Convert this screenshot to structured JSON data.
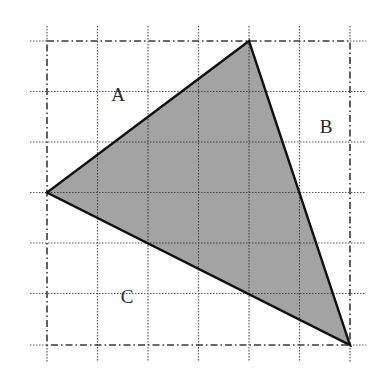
{
  "diagram": {
    "type": "grid-triangle",
    "grid": {
      "columns": 6,
      "rows": 6,
      "origin_px": [
        47,
        41
      ],
      "cell_px": 50.5,
      "line_color": "#555555",
      "border_style": "dash-dot",
      "inner_style": "dotted"
    },
    "triangle": {
      "vertices_grid": [
        [
          4,
          0
        ],
        [
          0,
          3
        ],
        [
          6,
          6
        ]
      ],
      "fill": "#9a9a9a",
      "stroke": "#111111"
    },
    "labels": [
      {
        "id": "A",
        "text": "A",
        "x": 118,
        "y": 101
      },
      {
        "id": "B",
        "text": "B",
        "x": 326,
        "y": 133
      },
      {
        "id": "C",
        "text": "C",
        "x": 127,
        "y": 303
      }
    ]
  }
}
